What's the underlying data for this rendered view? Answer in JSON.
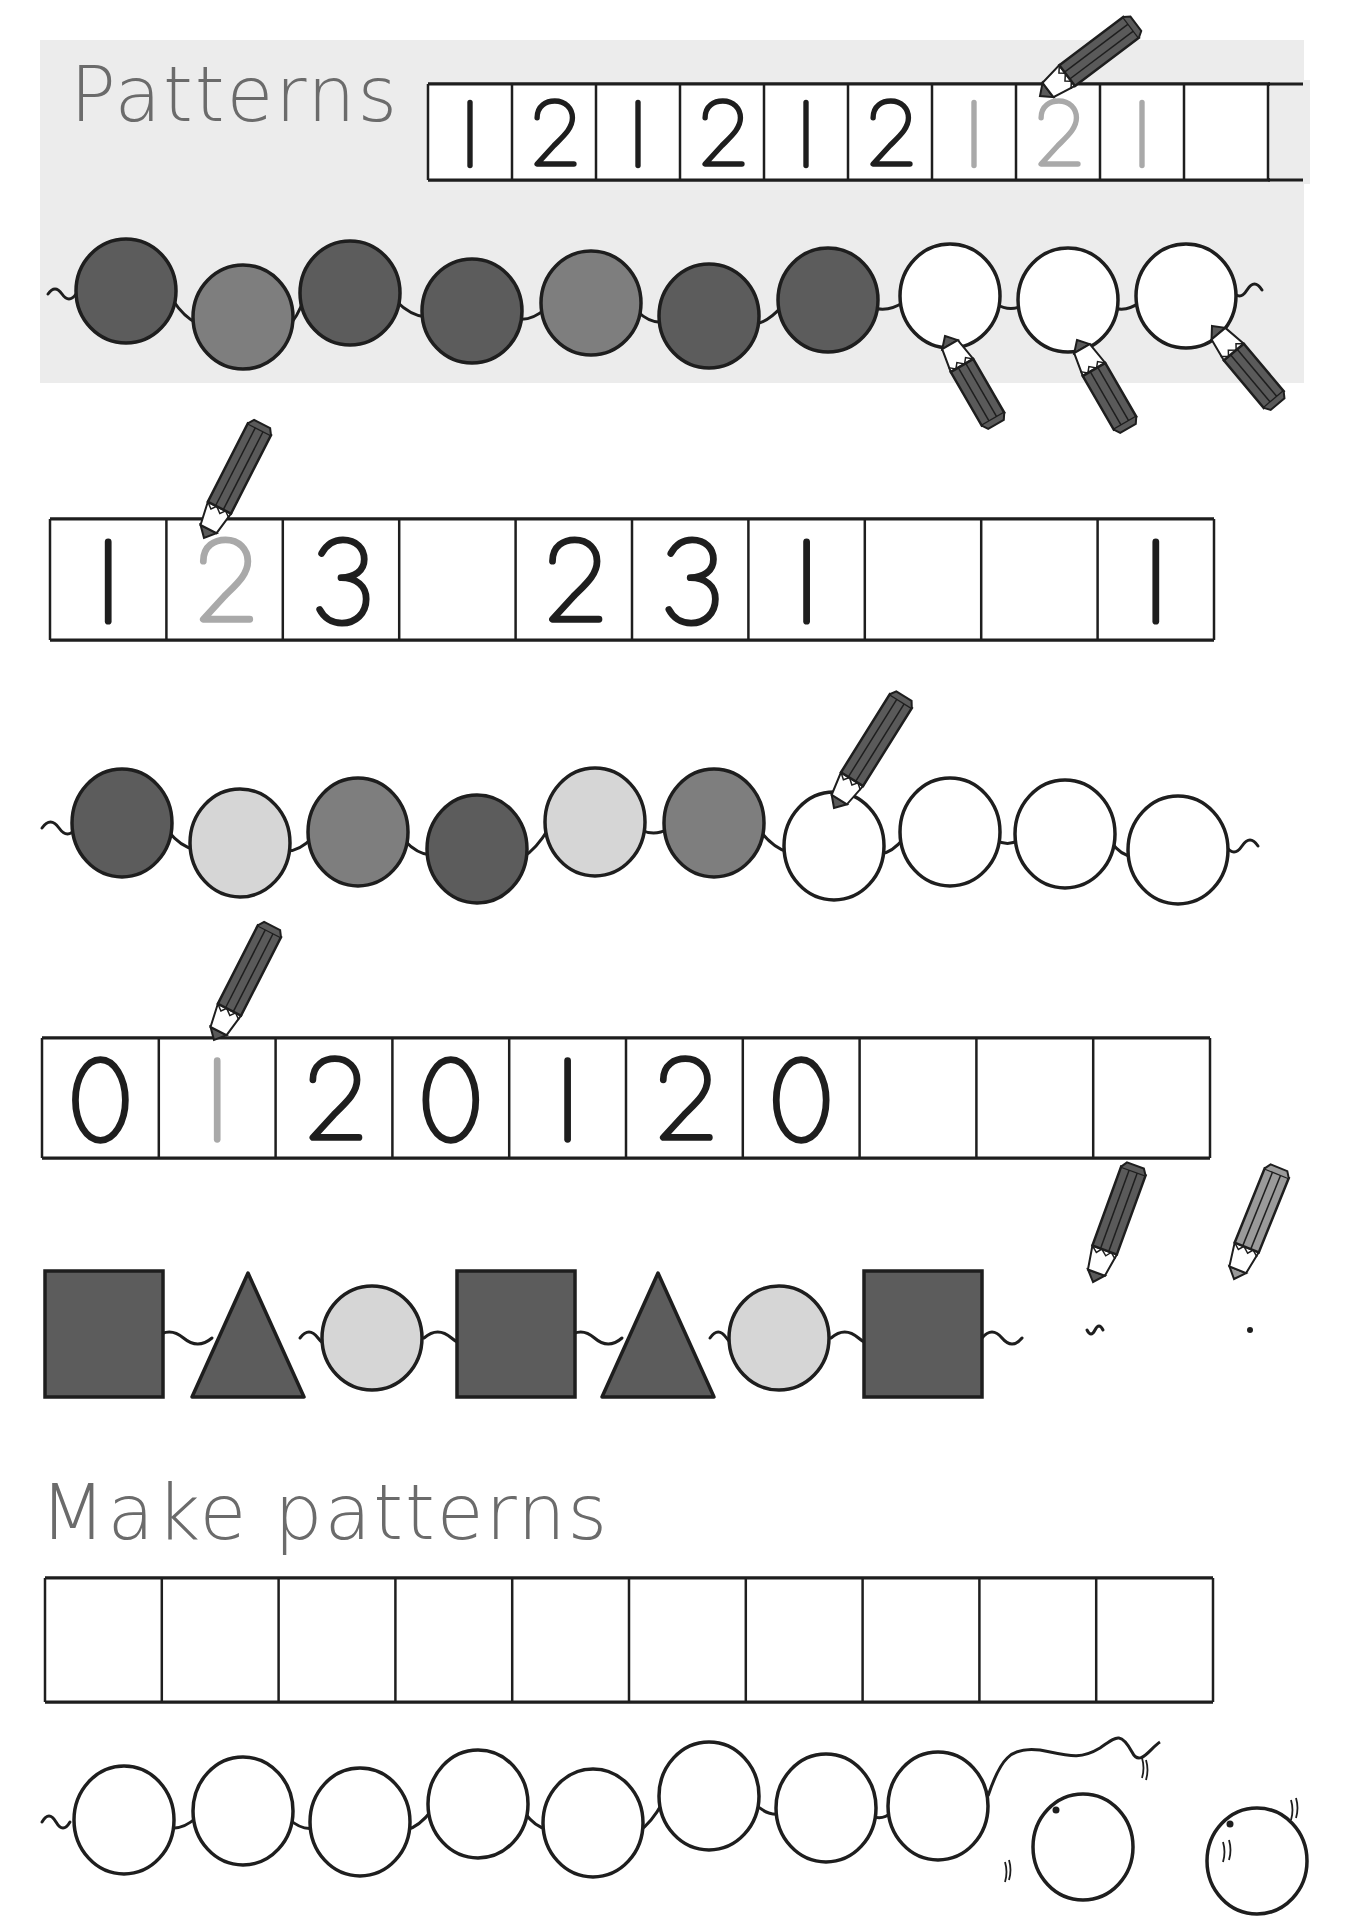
{
  "colors": {
    "panel": "#ececec",
    "title": "#6b6b6b",
    "ink": "#1e1e1e",
    "trace": "#a9a9a9",
    "dark": "#5c5c5c",
    "mid": "#7e7e7e",
    "light": "#d6d6d6",
    "white": "#ffffff",
    "pencil_dark": "#5a5a5a",
    "pencil_light": "#9a9a9a"
  },
  "titles": {
    "patterns": "Patterns",
    "make_patterns": "Make patterns"
  },
  "example": {
    "number_strip": {
      "cells": [
        {
          "text": "1",
          "style": "ink"
        },
        {
          "text": "2",
          "style": "ink"
        },
        {
          "text": "1",
          "style": "ink"
        },
        {
          "text": "2",
          "style": "ink"
        },
        {
          "text": "1",
          "style": "ink"
        },
        {
          "text": "2",
          "style": "ink"
        },
        {
          "text": "1",
          "style": "trace"
        },
        {
          "text": "2",
          "style": "trace"
        },
        {
          "text": "1",
          "style": "trace"
        },
        {
          "text": "",
          "style": "ink"
        }
      ]
    },
    "beads": [
      "dark",
      "mid",
      "dark",
      "dark",
      "mid",
      "dark",
      "dark",
      "white",
      "white",
      "white"
    ]
  },
  "exercises": [
    {
      "type": "number_strip",
      "cells": [
        {
          "text": "1",
          "style": "ink"
        },
        {
          "text": "2",
          "style": "trace"
        },
        {
          "text": "3",
          "style": "ink"
        },
        {
          "text": "",
          "style": "ink"
        },
        {
          "text": "2",
          "style": "ink"
        },
        {
          "text": "3",
          "style": "ink"
        },
        {
          "text": "1",
          "style": "ink"
        },
        {
          "text": "",
          "style": "ink"
        },
        {
          "text": "",
          "style": "ink"
        },
        {
          "text": "1",
          "style": "ink"
        }
      ]
    },
    {
      "type": "beads",
      "beads": [
        "dark",
        "light",
        "mid",
        "dark",
        "light",
        "mid",
        "white",
        "white",
        "white",
        "white"
      ]
    },
    {
      "type": "number_strip",
      "cells": [
        {
          "text": "0",
          "style": "ink"
        },
        {
          "text": "1",
          "style": "trace"
        },
        {
          "text": "2",
          "style": "ink"
        },
        {
          "text": "0",
          "style": "ink"
        },
        {
          "text": "1",
          "style": "ink"
        },
        {
          "text": "2",
          "style": "ink"
        },
        {
          "text": "0",
          "style": "ink"
        },
        {
          "text": "",
          "style": "ink"
        },
        {
          "text": "",
          "style": "ink"
        },
        {
          "text": "",
          "style": "ink"
        }
      ]
    },
    {
      "type": "shapes",
      "shapes": [
        "square",
        "triangle",
        "circle",
        "square",
        "triangle",
        "circle",
        "square"
      ],
      "shape_colors": {
        "square": "dark",
        "triangle": "dark",
        "circle": "light"
      },
      "pencils": [
        "pencil-dark",
        "pencil-light"
      ]
    }
  ],
  "make_patterns": {
    "empty_cells": 10,
    "outline_beads": 10
  }
}
